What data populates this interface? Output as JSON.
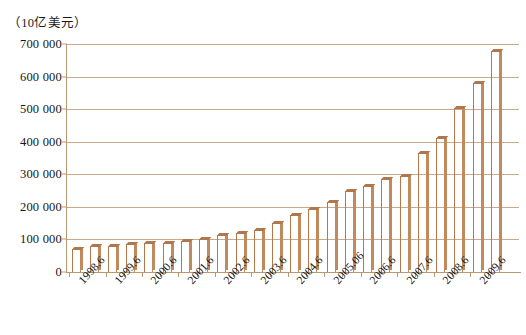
{
  "chart_data": {
    "type": "bar",
    "title": "",
    "subtitle": "",
    "xlabel": "",
    "ylabel": "（10亿美元）",
    "ylim": [
      0,
      700000
    ],
    "ytick_labels": [
      "0",
      "100 000",
      "200 000",
      "300 000",
      "400 000",
      "500 000",
      "600 000",
      "700 000"
    ],
    "ytick_values": [
      0,
      100000,
      200000,
      300000,
      400000,
      500000,
      600000,
      700000
    ],
    "grid": true,
    "legend": false,
    "legend_position": "none",
    "categories": [
      "1998.6",
      "1998.12",
      "1999.6",
      "1999.12",
      "2000.6",
      "2000.12",
      "2001.6",
      "2001.12",
      "2002.6",
      "2002.12",
      "2003.6",
      "2003.12",
      "2004.6",
      "2004.12",
      "2005.06",
      "2005.12",
      "2006.6",
      "2006.12",
      "2007.6",
      "2007.12",
      "2008.6",
      "2008.12",
      "2009.6",
      "2009.12"
    ],
    "visible_xtick_labels": [
      "1998.6",
      "1999.6",
      "2000.6",
      "2001.6",
      "2002.6",
      "2003.6",
      "2004.6",
      "2005.06",
      "2006.6",
      "2007.6",
      "2008.6",
      "2009.6"
    ],
    "values": [
      70000,
      80000,
      80000,
      85000,
      88000,
      90000,
      95000,
      100000,
      115000,
      120000,
      130000,
      150000,
      175000,
      195000,
      215000,
      250000,
      265000,
      285000,
      295000,
      365000,
      410000,
      505000,
      580000,
      680000
    ],
    "series": [
      {
        "name": "",
        "values": [
          70000,
          80000,
          80000,
          85000,
          88000,
          90000,
          95000,
          100000,
          115000,
          120000,
          130000,
          150000,
          175000,
          195000,
          215000,
          250000,
          265000,
          285000,
          295000,
          365000,
          410000,
          505000,
          580000,
          680000
        ]
      }
    ],
    "bar_values_ordered": [
      70000,
      80000,
      80000,
      85000,
      88000,
      90000,
      95000,
      100000,
      115000,
      120000,
      130000,
      150000,
      175000,
      195000,
      215000,
      250000,
      265000,
      285000,
      295000,
      365000,
      410000,
      505000,
      580000,
      680000,
      535000,
      595000,
      605000
    ],
    "bars": [
      {
        "label": "1998.6",
        "value": 70000,
        "tick_label_shown": true
      },
      {
        "label": "1998.12",
        "value": 80000,
        "tick_label_shown": false
      },
      {
        "label": "1999.6",
        "value": 80000,
        "tick_label_shown": true
      },
      {
        "label": "1999.12",
        "value": 85000,
        "tick_label_shown": false
      },
      {
        "label": "2000.6",
        "value": 88000,
        "tick_label_shown": true
      },
      {
        "label": "2000.12",
        "value": 90000,
        "tick_label_shown": false
      },
      {
        "label": "2001.6",
        "value": 95000,
        "tick_label_shown": true
      },
      {
        "label": "2001.12",
        "value": 100000,
        "tick_label_shown": false
      },
      {
        "label": "2002.6",
        "value": 115000,
        "tick_label_shown": true
      },
      {
        "label": "2002.12",
        "value": 120000,
        "tick_label_shown": false
      },
      {
        "label": "2003.6",
        "value": 130000,
        "tick_label_shown": true
      },
      {
        "label": "2003.12",
        "value": 150000,
        "tick_label_shown": false
      },
      {
        "label": "2004.6",
        "value": 175000,
        "tick_label_shown": true
      },
      {
        "label": "2004.12",
        "value": 195000,
        "tick_label_shown": false
      },
      {
        "label": "2005.06",
        "value": 215000,
        "tick_label_shown": true
      },
      {
        "label": "2005.12",
        "value": 250000,
        "tick_label_shown": false
      },
      {
        "label": "2006.6",
        "value": 265000,
        "tick_label_shown": true
      },
      {
        "label": "2006.12",
        "value": 285000,
        "tick_label_shown": false
      },
      {
        "label": "2007.6",
        "value": 295000,
        "tick_label_shown": true
      },
      {
        "label": "2007.12",
        "value": 365000,
        "tick_label_shown": false
      },
      {
        "label": "2008.6",
        "value": 410000,
        "tick_label_shown": true
      },
      {
        "label": "2008.12",
        "value": 505000,
        "tick_label_shown": false
      },
      {
        "label": "2009.6",
        "value": 580000,
        "tick_label_shown": true
      },
      {
        "label": "2009.12",
        "value": 680000,
        "tick_label_shown": false
      }
    ],
    "colors": {
      "bar_face_light": "#f4e5d2",
      "bar_face_mid": "#e8cdb0",
      "bar_edge": "#b5764a",
      "bar_side": "#c08a5d",
      "bar_top": "#b0764c",
      "gridline": "#c9a98a",
      "axis": "#b99873",
      "text": "#141414",
      "background": "#ffffff"
    }
  }
}
